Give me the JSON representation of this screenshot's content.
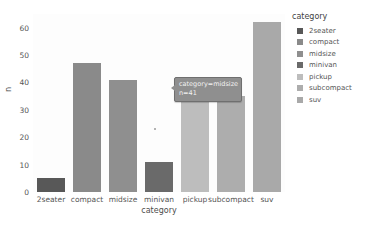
{
  "chart_data": {
    "type": "bar",
    "title": "",
    "xlabel": "category",
    "ylabel": "n",
    "categories": [
      "2seater",
      "compact",
      "midsize",
      "minivan",
      "pickup",
      "subcompact",
      "suv"
    ],
    "values": [
      5,
      47,
      41,
      11,
      33,
      35,
      62
    ],
    "ylim": [
      0,
      65
    ],
    "yticks": [
      "0",
      "10",
      "20",
      "30",
      "40",
      "50",
      "60"
    ],
    "ytick_values": [
      0,
      10,
      20,
      30,
      40,
      50,
      60
    ],
    "grid": false,
    "legend_position": "right",
    "colors": [
      "#585858",
      "#8a8a8a",
      "#8f8f8f",
      "#6a6a6a",
      "#bdbdbd",
      "#adadad",
      "#a9a9a9"
    ]
  },
  "legend": {
    "title": "category",
    "items": [
      {
        "label": "2seater",
        "color": "#585858"
      },
      {
        "label": "compact",
        "color": "#8a8a8a"
      },
      {
        "label": "midsize",
        "color": "#8f8f8f"
      },
      {
        "label": "minivan",
        "color": "#6a6a6a"
      },
      {
        "label": "pickup",
        "color": "#bdbdbd"
      },
      {
        "label": "subcompact",
        "color": "#adadad"
      },
      {
        "label": "suv",
        "color": "#a9a9a9"
      }
    ]
  },
  "tooltip": {
    "line1": "category=midsize",
    "line2": "n=41"
  }
}
